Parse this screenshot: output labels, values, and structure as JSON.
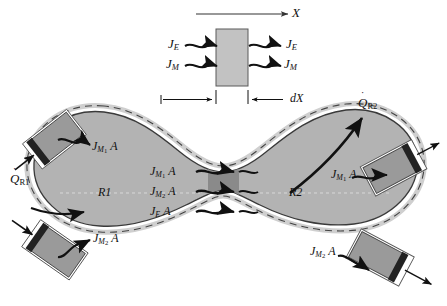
{
  "figure": {
    "colors": {
      "lobe_fill": "#b3b3b3",
      "lobe_stroke": "#3a3a3a",
      "neck_band": "#8a8a8a",
      "port_fill": "#9a9a9a",
      "port_dark": "#2b2b2b",
      "top_box_fill": "#c2c2c2",
      "ink": "#111111",
      "dashed": "#f2f2f2"
    }
  },
  "top_box": {
    "axis_label": "X",
    "thickness_label": "dX",
    "inflow": [
      {
        "symbol": "J",
        "subscript": "E"
      },
      {
        "symbol": "J",
        "subscript": "M"
      }
    ],
    "outflow": [
      {
        "symbol": "J",
        "subscript": "E"
      },
      {
        "symbol": "J",
        "subscript": "M"
      }
    ]
  },
  "regions": [
    {
      "id": "r1",
      "label": "R1"
    },
    {
      "id": "r2",
      "label": "R2"
    }
  ],
  "heat_fluxes": [
    {
      "id": "q-r1",
      "symbol": "Q",
      "dot": "˙",
      "subscript": "R1",
      "direction": "outward-left"
    },
    {
      "id": "q-r2",
      "symbol": "Q",
      "dot": "˙",
      "subscript": "R2",
      "direction": "outward-upper-right"
    }
  ],
  "flux_labels": [
    {
      "id": "top-left-port",
      "symbol": "J",
      "sub": "M",
      "sub2": "1",
      "area": "A"
    },
    {
      "id": "bottom-left-port",
      "symbol": "J",
      "sub": "M",
      "sub2": "2",
      "area": "A"
    },
    {
      "id": "top-right-port",
      "symbol": "J",
      "sub": "M",
      "sub2": "1",
      "area": "A"
    },
    {
      "id": "bottom-right-port",
      "symbol": "J",
      "sub": "M",
      "sub2": "2",
      "area": "A"
    },
    {
      "id": "neck-1",
      "symbol": "J",
      "sub": "M",
      "sub2": "1",
      "area": "A"
    },
    {
      "id": "neck-2",
      "symbol": "J",
      "sub": "M",
      "sub2": "2",
      "area": "A"
    },
    {
      "id": "neck-3",
      "symbol": "J",
      "sub": "E",
      "sub2": "",
      "area": "A"
    }
  ]
}
